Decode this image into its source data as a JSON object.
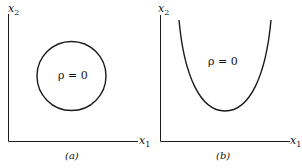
{
  "panels": [
    {
      "id": "a",
      "caption": "(a)",
      "y_axis_label": "x",
      "y_axis_sub": "2",
      "x_axis_label": "x",
      "x_axis_sub": "1",
      "region_label": "ρ = 0",
      "curve": "circle"
    },
    {
      "id": "b",
      "caption": "(b)",
      "y_axis_label": "x",
      "y_axis_sub": "2",
      "x_axis_label": "x",
      "x_axis_sub": "1",
      "region_label": "ρ = 0",
      "curve": "parabola"
    }
  ],
  "colors": {
    "line": "#1a1a1a",
    "background": "#ffffff"
  }
}
